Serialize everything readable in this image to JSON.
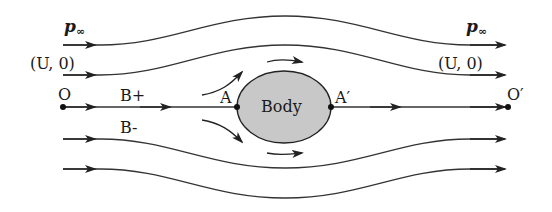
{
  "diagram": {
    "left_labels": {
      "pressure": "p",
      "pressure_sub": "∞",
      "velocity": "(U, 0)"
    },
    "right_labels": {
      "pressure": "p",
      "pressure_sub": "∞",
      "velocity": "(U, 0)"
    },
    "points": {
      "origin": "O",
      "origin_prime": "O′",
      "stagnation_front": "A",
      "stagnation_rear": "A′",
      "branch_upper": "B+",
      "branch_lower": "B-"
    },
    "body_label": "Body",
    "colors": {
      "line": "#222222",
      "body_fill": "#c8c8c8",
      "background": "#ffffff"
    }
  }
}
